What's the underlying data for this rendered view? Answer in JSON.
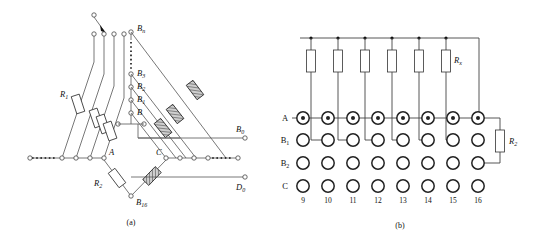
{
  "figure": {
    "panel_a": {
      "caption": "(a)",
      "labels": {
        "bn": "B",
        "bn_sub": "n",
        "b3": "B",
        "b3_sub": "3",
        "b2": "B",
        "b2_sub": "2",
        "b1": "B",
        "b1_sub": "1",
        "b": "B",
        "b16": "B",
        "b16_sub": "16",
        "r1": "R",
        "r1_sub": "1",
        "r2": "R",
        "r2_sub": "2",
        "a_node": "A",
        "c_node": "C",
        "b_out": "B",
        "b_out_sub": "0",
        "d_out": "D",
        "d_out_sub": "0"
      }
    },
    "panel_b": {
      "caption": "(b)",
      "row_labels": [
        {
          "name": "A",
          "sub": ""
        },
        {
          "name": "B",
          "sub": "1"
        },
        {
          "name": "B",
          "sub": "2"
        },
        {
          "name": "C",
          "sub": ""
        }
      ],
      "column_numbers": [
        "9",
        "10",
        "11",
        "12",
        "13",
        "14",
        "15",
        "16"
      ],
      "resistor_labels": {
        "rx": "R",
        "rx_sub": "x",
        "r2": "R",
        "r2_sub": "2"
      },
      "resistor_count": 6
    }
  },
  "colors": {
    "line": "#555555",
    "line_dark": "#222222",
    "ink": "#111111",
    "paper": "#ffffff"
  }
}
